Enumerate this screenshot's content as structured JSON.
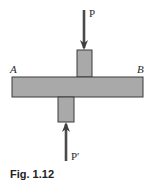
{
  "diagram": {
    "labels": {
      "left_end": "A",
      "right_end": "B",
      "top_force": "P",
      "bottom_force": "P′"
    },
    "caption": "Fig. 1.12",
    "colors": {
      "fill": "#a9a9a9",
      "stroke": "#3a3a3a",
      "arrow": "#4a4a4a"
    }
  }
}
